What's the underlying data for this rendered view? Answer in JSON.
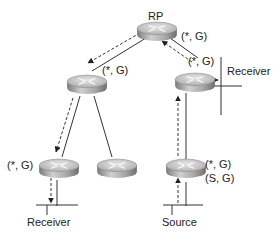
{
  "diagram": {
    "nodes": [
      {
        "id": "rp",
        "label": "RP",
        "state": "(*, G)"
      },
      {
        "id": "mid-left",
        "label": "",
        "state": "(*, G)"
      },
      {
        "id": "mid-right",
        "label": "",
        "state": "(*, G)"
      },
      {
        "id": "bottom-left",
        "label": "",
        "state": "(*, G)"
      },
      {
        "id": "bottom-middle",
        "label": "",
        "state": ""
      },
      {
        "id": "bottom-right",
        "label": "",
        "state": "(*, G)",
        "state2": "(S, G)"
      }
    ],
    "endpoints": {
      "receiver_left": "Receiver",
      "receiver_right": "Receiver",
      "source": "Source"
    },
    "edges": [
      {
        "from": "rp",
        "to": "mid-left",
        "style": "solid+dashed-arrow",
        "arrow_direction": "down"
      },
      {
        "from": "rp",
        "to": "mid-right",
        "style": "solid+dashed-arrow",
        "arrow_direction": "up"
      },
      {
        "from": "mid-left",
        "to": "bottom-left",
        "style": "solid+dashed-arrow",
        "arrow_direction": "down"
      },
      {
        "from": "mid-left",
        "to": "bottom-middle",
        "style": "solid"
      },
      {
        "from": "mid-right",
        "to": "receiver-right-lan",
        "style": "solid+dashed-arrow",
        "arrow_direction": "right"
      },
      {
        "from": "bottom-right",
        "to": "mid-right",
        "style": "solid+dashed-arrow",
        "arrow_direction": "up"
      },
      {
        "from": "bottom-left",
        "to": "receiver-left-lan",
        "style": "solid+dashed-arrow",
        "arrow_direction": "down"
      },
      {
        "from": "source-lan",
        "to": "bottom-right",
        "style": "solid+dashed-arrow",
        "arrow_direction": "up"
      }
    ],
    "colors": {
      "line": "#333333",
      "router_top": "#d8d8d8",
      "router_side": "#9a9a9a"
    }
  }
}
